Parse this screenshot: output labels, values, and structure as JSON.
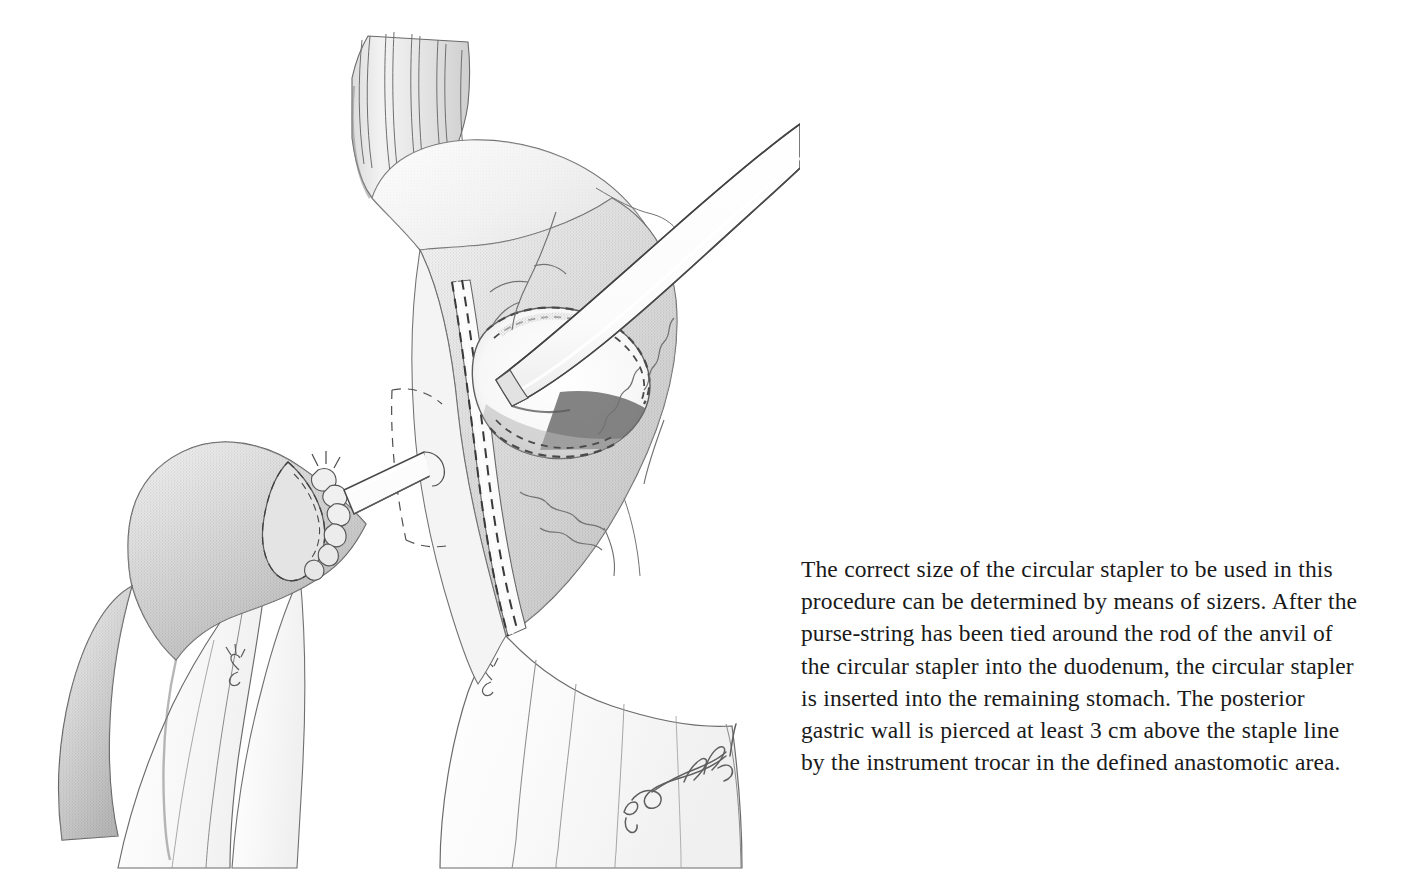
{
  "page": {
    "background_color": "#ffffff",
    "width": 1401,
    "height": 883
  },
  "figure": {
    "name": "surgical-illustration-circular-stapler-gastrojejunal-anastomosis",
    "medium": "graphite pencil line-and-stipple drawing",
    "ink_color": "#4a4a4a",
    "tissue_shade_light": "#e8e8e8",
    "tissue_shade_mid": "#c9c9c9",
    "tissue_shade_dark": "#9e9e9e",
    "artist_signature": "Sabathi",
    "anatomy_labels": [
      "esophagus with longitudinal muscle fibers",
      "gastric fundus",
      "remaining stomach",
      "double staple line",
      "gastrotomy opening",
      "duodenal stump with purse-string suture",
      "anvil rod of circular stapler",
      "circular stapler instrument shaft",
      "greater omentum / surgical drapes",
      "gastric serosal vessels"
    ]
  },
  "caption": {
    "text": "The correct size of the circular stapler to be used in this procedure can be determined by means of sizers. After the purse-string has been tied around the rod of the anvil of the circular stapler into the duodenum, the circular stapler is inserted into the remaining stomach. The posterior gastric wall is pierced at least 3 cm above the staple line by the instrument trocar in the defined anastomotic area.",
    "lines": [
      "The correct size of the circular stapler to be",
      "used in this procedure can be determined by",
      "means of sizers. After the purse-string has",
      "been tied around the rod of the anvil of the",
      "circular stapler into the duodenum, the circular",
      "stapler is inserted into the remaining stomach.",
      "The posterior gastric wall is pierced at least",
      "3 cm above the staple line by the instrument",
      "trocar in the defined anastomotic area."
    ],
    "font_size_px": 23.5,
    "line_height_px": 32.2,
    "color": "#1a1a1a"
  }
}
